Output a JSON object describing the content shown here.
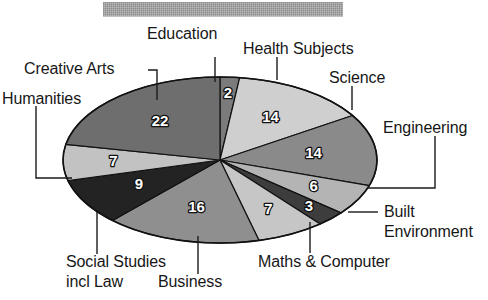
{
  "title_bar": {
    "name": "masked-title-bar",
    "color": "#9a9a9a",
    "note": ""
  },
  "chart_data": {
    "type": "pie",
    "title": "",
    "subtitle": "",
    "xlabel": "",
    "ylabel": "",
    "legend_position": "none",
    "grid": false,
    "total": 100,
    "units": "%",
    "labels_show_values": true,
    "start_angle_deg": 0,
    "direction": "clockwise",
    "categories": [
      "Education",
      "Health Subjects",
      "Science",
      "Engineering",
      "Built Environment",
      "Maths & Computer",
      "Business",
      "Social Studies incl Law",
      "Humanities",
      "Creative Arts"
    ],
    "values": [
      2,
      14,
      14,
      6,
      3,
      7,
      16,
      9,
      7,
      22
    ],
    "slices": [
      {
        "label": "Education",
        "value": 2,
        "value_text": "2",
        "color": "#7b7b7b"
      },
      {
        "label": "Health Subjects",
        "value": 14,
        "value_text": "14",
        "color": "#cfcfcf"
      },
      {
        "label": "Science",
        "value": 14,
        "value_text": "14",
        "color": "#8a8a8a"
      },
      {
        "label": "Engineering",
        "value": 6,
        "value_text": "6",
        "color": "#b4b4b4"
      },
      {
        "label": "Built Environment",
        "value": 3,
        "value_text": "3",
        "color": "#3d3d3d"
      },
      {
        "label": "Maths & Computer",
        "value": 7,
        "value_text": "7",
        "color": "#c6c6c6"
      },
      {
        "label": "Business",
        "value": 16,
        "value_text": "16",
        "color": "#8f8f8f"
      },
      {
        "label": "Social Studies incl Law",
        "value": 9,
        "value_text": "9",
        "color": "#232323"
      },
      {
        "label": "Humanities",
        "value": 7,
        "value_text": "7",
        "color": "#c2c2c2"
      },
      {
        "label": "Creative Arts",
        "value": 22,
        "value_text": "22",
        "color": "#6e6e6e"
      }
    ]
  },
  "labels": {
    "education": "Education",
    "health_subjects": "Health Subjects",
    "science": "Science",
    "engineering": "Engineering",
    "built_line1": "Built",
    "built_line2": "Environment",
    "maths_computer": "Maths & Computer",
    "business": "Business",
    "social_line1": "Social Studies",
    "social_line2": "incl Law",
    "humanities": "Humanities",
    "creative_arts": "Creative Arts"
  },
  "values_text": {
    "education": "2",
    "health_subjects": "14",
    "science": "14",
    "engineering": "6",
    "built_environment": "3",
    "maths_computer": "7",
    "business": "16",
    "social_studies": "9",
    "humanities": "7",
    "creative_arts": "22"
  }
}
